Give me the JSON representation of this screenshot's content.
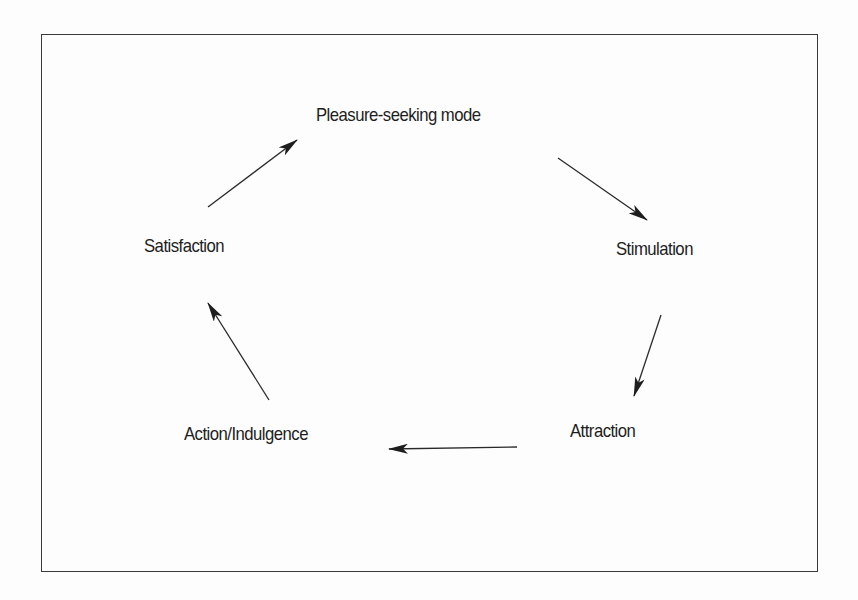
{
  "diagram": {
    "type": "cycle",
    "nodes": [
      {
        "id": "pleasure",
        "label": "Pleasure-seeking mode"
      },
      {
        "id": "stimulation",
        "label": "Stimulation"
      },
      {
        "id": "attraction",
        "label": "Attraction"
      },
      {
        "id": "action",
        "label": "Action/Indulgence"
      },
      {
        "id": "satisfaction",
        "label": "Satisfaction"
      }
    ],
    "edges": [
      {
        "from": "pleasure",
        "to": "stimulation"
      },
      {
        "from": "stimulation",
        "to": "attraction"
      },
      {
        "from": "attraction",
        "to": "action"
      },
      {
        "from": "action",
        "to": "satisfaction"
      },
      {
        "from": "satisfaction",
        "to": "pleasure"
      }
    ],
    "colors": {
      "line": "#2a2a2a",
      "text": "#1e1e1e",
      "border": "#3a3a3a"
    }
  }
}
